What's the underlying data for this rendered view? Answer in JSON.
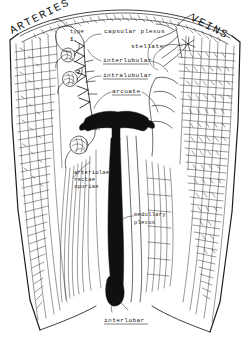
{
  "figure": {
    "kind": "anatomical-line-drawing",
    "titles": {
      "left": "ARTERIES",
      "right": "VEINS"
    },
    "labels": [
      {
        "id": "type-1",
        "text": "type",
        "text2": "1.",
        "x": 72,
        "y": 33
      },
      {
        "id": "capsular-plexus",
        "text": "capsular plexus",
        "x": 104,
        "y": 31
      },
      {
        "id": "stellate",
        "text": "stellate",
        "x": 131,
        "y": 46
      },
      {
        "id": "interlobular",
        "text": "interlobular",
        "x": 103,
        "y": 62
      },
      {
        "id": "intralobular",
        "text": "intralobular",
        "x": 103,
        "y": 77
      },
      {
        "id": "arcuate",
        "text": "arcuate",
        "x": 112,
        "y": 93
      },
      {
        "id": "arteriolae-rectae-spuriae",
        "lines": [
          "arteriolae",
          "rectae",
          "spuriae"
        ],
        "x": 74,
        "y": 172
      },
      {
        "id": "medullary-plexus",
        "lines": [
          "medullary",
          "plexus"
        ],
        "x": 134,
        "y": 214
      },
      {
        "id": "interlobar",
        "text": "interlobar",
        "x": 104,
        "y": 322
      }
    ],
    "markers": [
      {
        "id": "marker-1",
        "text": "1.",
        "x": 73,
        "y": 41
      },
      {
        "id": "marker-2",
        "text": "2.",
        "x": 79,
        "y": 73
      },
      {
        "id": "marker-3",
        "text": "3.",
        "x": 95,
        "y": 129
      }
    ],
    "colors": {
      "ink": "#1d1d1d",
      "fill_solid": "#101010",
      "background": "#ffffff"
    }
  }
}
